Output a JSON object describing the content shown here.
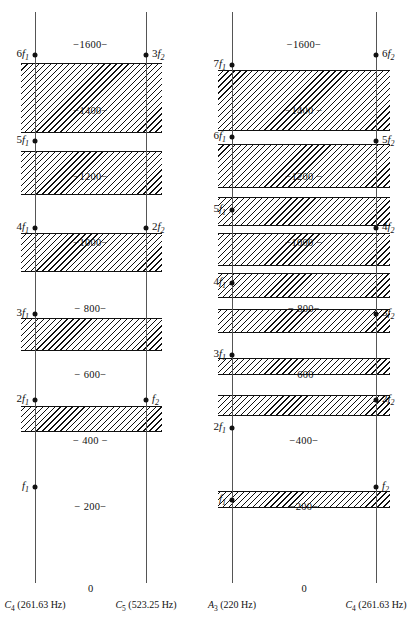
{
  "figure": {
    "type": "critical-band-diagram",
    "zero_label": "0",
    "scale": {
      "hz_min": 0,
      "hz_max": 1700,
      "axis_top_hz": 1700,
      "axis_bottom_hz": 0
    }
  },
  "panels": [
    {
      "id": "left",
      "name": "octave-C4-C5",
      "axes": [
        {
          "id": "left-axis",
          "position": "left",
          "note_prefix": "C",
          "note_sub": "4",
          "note_freq": "(261.63 Hz)",
          "full_label": "C4 (261.63 Hz)",
          "fundamental_hz": 261.63,
          "harmonics": [
            {
              "label_num": "",
              "label_f": "f",
              "label_sub": "1",
              "text": "f1",
              "hz": 261.63
            },
            {
              "label_num": "2",
              "label_f": "f",
              "label_sub": "1",
              "text": "2f1",
              "hz": 523.25
            },
            {
              "label_num": "3",
              "label_f": "f",
              "label_sub": "1",
              "text": "3f1",
              "hz": 784.88
            },
            {
              "label_num": "4",
              "label_f": "f",
              "label_sub": "1",
              "text": "4f1",
              "hz": 1046.5
            },
            {
              "label_num": "5",
              "label_f": "f",
              "label_sub": "1",
              "text": "5f1",
              "hz": 1308.1
            },
            {
              "label_num": "6",
              "label_f": "f",
              "label_sub": "1",
              "text": "6f1",
              "hz": 1569.8
            }
          ]
        },
        {
          "id": "right-axis",
          "position": "right",
          "note_prefix": "C",
          "note_sub": "5",
          "note_freq": "(523.25 Hz)",
          "full_label": "C5 (523.25 Hz)",
          "fundamental_hz": 523.25,
          "harmonics": [
            {
              "label_num": "",
              "label_f": "f",
              "label_sub": "2",
              "text": "f2",
              "hz": 523.25
            },
            {
              "label_num": "2",
              "label_f": "f",
              "label_sub": "2",
              "text": "2f2",
              "hz": 1046.5
            },
            {
              "label_num": "3",
              "label_f": "f",
              "label_sub": "2",
              "text": "3f2",
              "hz": 1569.8
            }
          ]
        }
      ],
      "ticks": [
        {
          "text": "−1600−",
          "hz": 1600
        },
        {
          "text": "−1400−",
          "hz": 1400
        },
        {
          "text": "−1200−",
          "hz": 1200
        },
        {
          "text": "−1000−",
          "hz": 1000
        },
        {
          "text": "− 800−",
          "hz": 800
        },
        {
          "text": "− 600−",
          "hz": 600
        },
        {
          "text": "− 400 −",
          "hz": 400
        },
        {
          "text": "− 200−",
          "hz": 200
        }
      ],
      "bands": [
        {
          "from_hz": 1332,
          "to_hz": 1545
        },
        {
          "from_hz": 1145,
          "to_hz": 1280
        },
        {
          "from_hz": 912,
          "to_hz": 1030
        },
        {
          "from_hz": 672,
          "to_hz": 772
        },
        {
          "from_hz": 428,
          "to_hz": 506
        }
      ]
    },
    {
      "id": "right",
      "name": "minor-third-A3-C4",
      "axes": [
        {
          "id": "left-axis",
          "position": "left",
          "note_prefix": "A",
          "note_sub": "3",
          "note_freq": "(220 Hz)",
          "full_label": "A3 (220 Hz)",
          "fundamental_hz": 220,
          "harmonics": [
            {
              "label_num": "",
              "label_f": "f",
              "label_sub": "1",
              "text": "f1",
              "hz": 220
            },
            {
              "label_num": "2",
              "label_f": "f",
              "label_sub": "1",
              "text": "2f1",
              "hz": 440
            },
            {
              "label_num": "3",
              "label_f": "f",
              "label_sub": "1",
              "text": "3f1",
              "hz": 660
            },
            {
              "label_num": "4",
              "label_f": "f",
              "label_sub": "1",
              "text": "4f1",
              "hz": 880
            },
            {
              "label_num": "5",
              "label_f": "f",
              "label_sub": "1",
              "text": "5f1",
              "hz": 1100
            },
            {
              "label_num": "6",
              "label_f": "f",
              "label_sub": "1",
              "text": "6f1",
              "hz": 1320
            },
            {
              "label_num": "7",
              "label_f": "f",
              "label_sub": "1",
              "text": "7f1",
              "hz": 1540
            }
          ]
        },
        {
          "id": "right-axis",
          "position": "right",
          "note_prefix": "C",
          "note_sub": "4",
          "note_freq": "(261.63 Hz)",
          "full_label": "C4 (261.63 Hz)",
          "fundamental_hz": 261.63,
          "harmonics": [
            {
              "label_num": "",
              "label_f": "f",
              "label_sub": "2",
              "text": "f2",
              "hz": 261.63
            },
            {
              "label_num": "2",
              "label_f": "f",
              "label_sub": "2",
              "text": "2f2",
              "hz": 523.25
            },
            {
              "label_num": "3",
              "label_f": "f",
              "label_sub": "2",
              "text": "3f2",
              "hz": 784.88
            },
            {
              "label_num": "4",
              "label_f": "f",
              "label_sub": "2",
              "text": "4f2",
              "hz": 1046.5
            },
            {
              "label_num": "5",
              "label_f": "f",
              "label_sub": "2",
              "text": "5f2",
              "hz": 1308.1
            },
            {
              "label_num": "6",
              "label_f": "f",
              "label_sub": "2",
              "text": "6f2",
              "hz": 1569.8
            }
          ]
        }
      ],
      "ticks": [
        {
          "text": "−1600−",
          "hz": 1600
        },
        {
          "text": "−1400 −",
          "hz": 1400
        },
        {
          "text": "−1200 −",
          "hz": 1200
        },
        {
          "text": "−1000 −",
          "hz": 1000
        },
        {
          "text": "− 800−",
          "hz": 800
        },
        {
          "text": "− 600−",
          "hz": 600
        },
        {
          "text": "−400−",
          "hz": 400
        },
        {
          "text": "−200−",
          "hz": 200
        }
      ],
      "bands": [
        {
          "from_hz": 1340,
          "to_hz": 1525
        },
        {
          "from_hz": 1168,
          "to_hz": 1300
        },
        {
          "from_hz": 1052,
          "to_hz": 1140
        },
        {
          "from_hz": 930,
          "to_hz": 1030
        },
        {
          "from_hz": 832,
          "to_hz": 908
        },
        {
          "from_hz": 728,
          "to_hz": 800
        },
        {
          "from_hz": 600,
          "to_hz": 652
        },
        {
          "from_hz": 476,
          "to_hz": 540
        },
        {
          "from_hz": 196,
          "to_hz": 248
        }
      ]
    }
  ],
  "colors": {
    "ink": "#111111",
    "axis": "#555555",
    "paper": "#ffffff"
  }
}
